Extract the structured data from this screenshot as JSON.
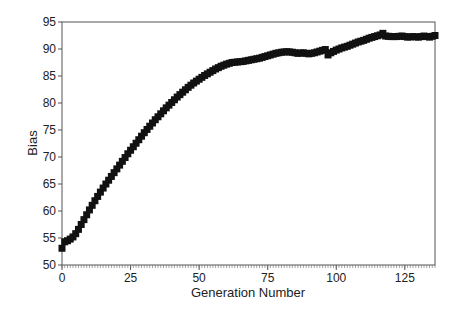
{
  "chart_data": {
    "type": "scatter",
    "title": "",
    "xlabel": "Generation Number",
    "ylabel": "Bias",
    "xlim": [
      0,
      136
    ],
    "ylim": [
      50,
      95
    ],
    "xticks": [
      0,
      25,
      50,
      75,
      100,
      125
    ],
    "yticks": [
      50,
      55,
      60,
      65,
      70,
      75,
      80,
      85,
      90,
      95
    ],
    "grid": false,
    "legend": null,
    "marker": "square",
    "marker_color": "#111111",
    "series": [
      {
        "name": "Bias",
        "x": [
          0,
          1,
          2,
          3,
          4,
          5,
          6,
          7,
          8,
          9,
          10,
          12,
          14,
          16,
          18,
          20,
          22,
          24,
          26,
          28,
          30,
          32,
          34,
          36,
          38,
          40,
          42,
          44,
          46,
          48,
          50,
          52,
          54,
          56,
          58,
          60,
          62,
          64,
          66,
          68,
          70,
          72,
          74,
          76,
          78,
          80,
          82,
          84,
          86,
          88,
          90,
          92,
          94,
          96,
          97,
          98,
          100,
          102,
          104,
          106,
          108,
          110,
          112,
          114,
          116,
          117,
          118,
          120,
          122,
          124,
          126,
          128,
          130,
          132,
          134,
          136
        ],
        "values": [
          53.1,
          54.3,
          54.5,
          54.8,
          55.2,
          55.8,
          56.6,
          57.5,
          58.4,
          59.3,
          60.2,
          61.9,
          63.5,
          65.0,
          66.4,
          67.8,
          69.2,
          70.6,
          71.9,
          73.2,
          74.5,
          75.7,
          76.9,
          78.0,
          79.1,
          80.1,
          81.1,
          82.0,
          82.9,
          83.7,
          84.4,
          85.1,
          85.7,
          86.3,
          86.8,
          87.2,
          87.5,
          87.6,
          87.7,
          87.9,
          88.1,
          88.3,
          88.6,
          88.9,
          89.2,
          89.4,
          89.5,
          89.4,
          89.2,
          89.3,
          89.1,
          89.3,
          89.6,
          89.9,
          88.9,
          89.3,
          89.8,
          90.2,
          90.5,
          90.9,
          91.3,
          91.6,
          92.0,
          92.3,
          92.6,
          92.9,
          92.4,
          92.3,
          92.3,
          92.4,
          92.2,
          92.3,
          92.2,
          92.4,
          92.2,
          92.5
        ]
      }
    ]
  }
}
